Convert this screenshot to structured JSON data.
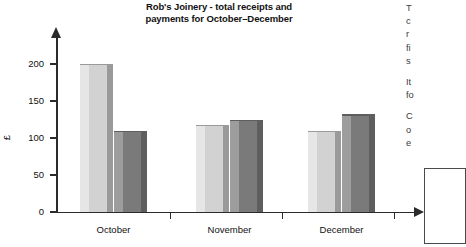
{
  "chart_data": {
    "type": "bar",
    "title": "Rob's Joinery - total receipts and payments for October–December",
    "title_line1": "Rob's Joinery - total receipts and",
    "title_line2": "payments for October–December",
    "xlabel": "",
    "ylabel": "£",
    "ylim": [
      0,
      225
    ],
    "yticks": [
      0,
      50,
      100,
      150,
      200
    ],
    "ytick_labels": [
      "0",
      "50",
      "100",
      "150",
      "200"
    ],
    "grid": false,
    "legend": "none",
    "categories": [
      "October",
      "November",
      "December"
    ],
    "series": [
      {
        "name": "receipts",
        "color": "#d2d2d2",
        "color_left": "#e6e6e6",
        "color_right": "#9a9a9a",
        "values": [
          200,
          118,
          110
        ]
      },
      {
        "name": "payments",
        "color": "#7a7a7a",
        "color_left": "#9d9d9d",
        "color_right": "#5e5e5e",
        "values": [
          110,
          125,
          132
        ]
      }
    ],
    "axis_color": "#2b2b2b"
  },
  "side_text": {
    "paragraph1": [
      "T",
      "c",
      "r",
      "fi",
      "s"
    ],
    "paragraph2": [
      "It",
      "fo"
    ],
    "paragraph3": [
      "C",
      "o",
      "e"
    ]
  }
}
